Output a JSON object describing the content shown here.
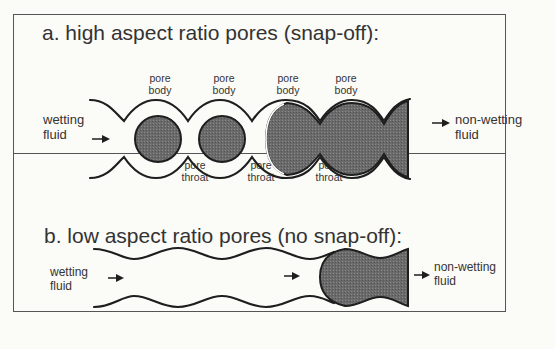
{
  "page_number": "I-23",
  "panel_a": {
    "title": "a. high aspect ratio pores (snap-off):",
    "pore_body_labels": [
      {
        "line1": "pore",
        "line2": "body"
      },
      {
        "line1": "pore",
        "line2": "body"
      },
      {
        "line1": "pore",
        "line2": "body"
      },
      {
        "line1": "pore",
        "line2": "body"
      }
    ],
    "pore_throat_labels": [
      {
        "line1": "pore",
        "line2": "throat"
      },
      {
        "line1": "pore",
        "line2": "throat"
      },
      {
        "line1": "pore",
        "line2": "throat"
      }
    ],
    "inlet": {
      "line1": "wetting",
      "line2": "fluid"
    },
    "outlet": {
      "line1": "non-wetting",
      "line2": "fluid"
    }
  },
  "panel_b": {
    "title": "b. low aspect ratio pores (no snap-off):",
    "inlet": {
      "line1": "wetting",
      "line2": "fluid"
    },
    "outlet": {
      "line1": "non-wetting",
      "line2": "fluid"
    }
  },
  "colors": {
    "outline": "#222222",
    "fill_nonwetting": "#6e6e6e",
    "frame": "#444444",
    "background": "#fbfbf8"
  }
}
